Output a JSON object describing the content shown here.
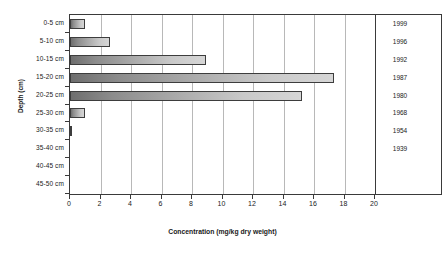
{
  "chart_data": {
    "type": "bar",
    "orientation": "horizontal",
    "title": "",
    "xlabel": "Concentration (mg/kg dry weight)",
    "ylabel": "Depth (cm)",
    "secondary_ylabel": "Year",
    "xlim": [
      0,
      20
    ],
    "xticks": [
      0,
      2,
      4,
      6,
      8,
      10,
      12,
      14,
      16,
      18,
      20
    ],
    "xtick_labels": [
      "0",
      "2",
      "4",
      "6",
      "8",
      "10",
      "12",
      "14",
      "16",
      "18",
      "20"
    ],
    "grid": "vertical",
    "legend": "none",
    "categories": [
      "0-5 cm",
      "5-10 cm",
      "10-15 cm",
      "15-20 cm",
      "20-25 cm",
      "25-30 cm",
      "30-35 cm",
      "35-40 cm",
      "40-45 cm",
      "45-50 cm"
    ],
    "values": [
      1.0,
      2.6,
      8.9,
      17.3,
      15.2,
      1.0,
      0.05,
      0,
      0,
      0
    ],
    "secondary_axis_labels": [
      "1999",
      "1996",
      "1992",
      "1987",
      "1980",
      "1968",
      "1954",
      "1939"
    ],
    "bar_color": "#8c8c8c",
    "bar_edge_color": "#3d3d3d",
    "gridline_color": "#b8b8b8",
    "axis_color": "#3a3a3a",
    "background_color": "#ffffff"
  }
}
